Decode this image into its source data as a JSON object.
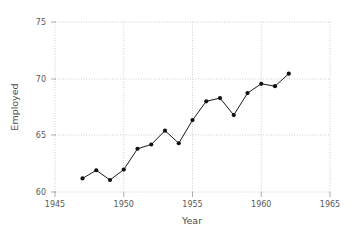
{
  "chart_data": {
    "type": "line",
    "title": "",
    "subtitle": "",
    "xlabel": "Year",
    "ylabel": "Employed",
    "xlim": [
      1945,
      1965
    ],
    "ylim": [
      59.0,
      75.6
    ],
    "xticks": [
      1945,
      1950,
      1955,
      1960,
      1965
    ],
    "xticklabels": [
      "1945",
      "1950",
      "1955",
      "1960",
      "1965"
    ],
    "yticks": [
      60,
      65,
      70,
      75
    ],
    "yticklabels": [
      "60",
      "65",
      "70",
      "75"
    ],
    "grid": true,
    "grid_style": "dotted",
    "legend": false,
    "legend_position": "none",
    "marker": "filled-circle",
    "line_color": "#1a1a1a",
    "marker_color": "#111111",
    "grid_color": "#b9b9b9",
    "background_color": "#ffffff",
    "x": [
      1947,
      1948,
      1949,
      1950,
      1951,
      1952,
      1953,
      1954,
      1955,
      1956,
      1957,
      1958,
      1959,
      1960,
      1961,
      1962
    ],
    "series": [
      {
        "name": "Employed",
        "values": [
          60.323,
          61.122,
          60.171,
          61.187,
          63.221,
          63.639,
          64.989,
          63.761,
          66.019,
          67.857,
          68.169,
          66.513,
          68.655,
          69.564,
          69.331,
          70.551
        ]
      }
    ]
  },
  "axes": {
    "x_axis_name": "year-axis",
    "y_axis_name": "employed-axis"
  }
}
